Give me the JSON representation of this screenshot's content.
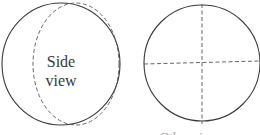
{
  "diagram": {
    "left": {
      "label_line1": "Side",
      "label_line2": "view",
      "outline_color": "#3a3a3a",
      "dashed_color": "#555555"
    },
    "right": {
      "caption": "Other view",
      "outline_color": "#3a3a3a",
      "dashed_color": "#555555"
    }
  }
}
